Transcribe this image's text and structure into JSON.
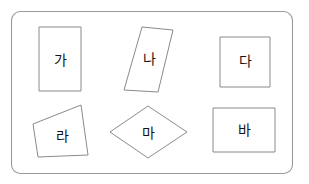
{
  "figure": {
    "name": "shape-classification-worksheet",
    "background_color": "#ffffff",
    "panel": {
      "name": "outer-rounded-panel",
      "x": 11,
      "y": 11,
      "width": 282,
      "height": 163,
      "corner_radius": 9,
      "stroke_color": "#9a9a9a",
      "fill_color": "#ffffff"
    },
    "stroke_color": "#8a8a8a",
    "label_color": "#141414"
  },
  "shapes": [
    {
      "id": "ga",
      "label": "가",
      "shape_type": "rectangle",
      "description": "portrait rectangle",
      "points": "39,27 81,27 81,91 39,91",
      "label_x": 60,
      "label_y": 60
    },
    {
      "id": "na",
      "label": "나",
      "shape_type": "parallelogram",
      "description": "slanted parallelogram leaning right",
      "points": "142,27 173,30 158,92 124,90",
      "label_x": 149,
      "label_y": 59
    },
    {
      "id": "da",
      "label": "다",
      "shape_type": "square",
      "description": "square",
      "points": "220,37 270,37 270,87 220,87",
      "label_x": 245,
      "label_y": 61
    },
    {
      "id": "ra",
      "label": "라",
      "shape_type": "quadrilateral",
      "description": "irregular quadrilateral",
      "points": "81,105 88,155 38,157 33,124",
      "label_x": 62,
      "label_y": 136
    },
    {
      "id": "ma",
      "label": "마",
      "shape_type": "rhombus",
      "description": "rhombus / diamond",
      "points": "148,106 187,132 148,158 110,132",
      "label_x": 148,
      "label_y": 133
    },
    {
      "id": "ba",
      "label": "바",
      "shape_type": "rectangle",
      "description": "landscape rectangle",
      "points": "213,108 275,108 275,152 213,152",
      "label_x": 244,
      "label_y": 130
    }
  ]
}
